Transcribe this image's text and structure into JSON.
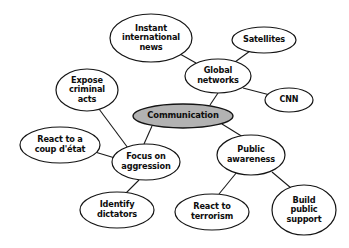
{
  "diagram": {
    "type": "mind-map",
    "background_color": "#ffffff",
    "node_fill_color": "#ffffff",
    "central_node_fill_color": "#b2b2b2",
    "stroke_color": "#141414",
    "text_color": "#0d0d0d",
    "nodes": [
      {
        "id": "communication",
        "label": "Communication",
        "role": "central",
        "cx": 183,
        "cy": 116,
        "rx": 50,
        "ry": 12
      },
      {
        "id": "global-networks",
        "label": "Global\nnetworks",
        "role": "branch",
        "cx": 218,
        "cy": 76,
        "rx": 33,
        "ry": 17
      },
      {
        "id": "instant-international-news",
        "label": "Instant\ninternational\nnews",
        "role": "leaf",
        "cx": 151,
        "cy": 38,
        "rx": 41,
        "ry": 24
      },
      {
        "id": "satellites",
        "label": "Satellites",
        "role": "leaf",
        "cx": 264,
        "cy": 40,
        "rx": 32,
        "ry": 13
      },
      {
        "id": "cnn",
        "label": "CNN",
        "role": "leaf",
        "cx": 289,
        "cy": 100,
        "rx": 24,
        "ry": 12
      },
      {
        "id": "expose-criminal-acts",
        "label": "Expose\ncriminal\nacts",
        "role": "leaf",
        "cx": 87,
        "cy": 90,
        "rx": 31,
        "ry": 21
      },
      {
        "id": "react-to-a-coup-detat",
        "label": "React to a\ncoup d'état",
        "role": "leaf",
        "cx": 60,
        "cy": 145,
        "rx": 40,
        "ry": 18
      },
      {
        "id": "focus-on-aggression",
        "label": "Focus on\naggression",
        "role": "branch",
        "cx": 146,
        "cy": 162,
        "rx": 34,
        "ry": 18
      },
      {
        "id": "identify-dictators",
        "label": "Identify\ndictators",
        "role": "leaf",
        "cx": 117,
        "cy": 210,
        "rx": 37,
        "ry": 18
      },
      {
        "id": "public-awareness",
        "label": "Public\nawareness",
        "role": "branch",
        "cx": 251,
        "cy": 155,
        "rx": 34,
        "ry": 20
      },
      {
        "id": "react-to-terrorism",
        "label": "React to\nterrorism",
        "role": "leaf",
        "cx": 212,
        "cy": 212,
        "rx": 37,
        "ry": 18
      },
      {
        "id": "build-public-support",
        "label": "Build\npublic\nsupport",
        "role": "leaf",
        "cx": 304,
        "cy": 210,
        "rx": 32,
        "ry": 25
      }
    ],
    "edges": [
      {
        "from": "communication",
        "to": "global-networks",
        "x1": 210,
        "y1": 105,
        "x2": 218,
        "y2": 93
      },
      {
        "from": "communication",
        "to": "focus-on-aggression",
        "x1": 152,
        "y1": 126,
        "x2": 144,
        "y2": 144
      },
      {
        "from": "communication",
        "to": "public-awareness",
        "x1": 222,
        "y1": 124,
        "x2": 243,
        "y2": 137
      },
      {
        "from": "global-networks",
        "to": "instant-international-news",
        "x1": 196,
        "y1": 63,
        "x2": 180,
        "y2": 54
      },
      {
        "from": "global-networks",
        "to": "satellites",
        "x1": 235,
        "y1": 62,
        "x2": 250,
        "y2": 51
      },
      {
        "from": "global-networks",
        "to": "cnn",
        "x1": 243,
        "y1": 88,
        "x2": 270,
        "y2": 95
      },
      {
        "from": "focus-on-aggression",
        "to": "expose-criminal-acts",
        "x1": 128,
        "y1": 148,
        "x2": 99,
        "y2": 109
      },
      {
        "from": "focus-on-aggression",
        "to": "react-to-a-coup-detat",
        "x1": 115,
        "y1": 158,
        "x2": 95,
        "y2": 152
      },
      {
        "from": "focus-on-aggression",
        "to": "identify-dictators",
        "x1": 139,
        "y1": 180,
        "x2": 126,
        "y2": 193
      },
      {
        "from": "public-awareness",
        "to": "react-to-terrorism",
        "x1": 237,
        "y1": 172,
        "x2": 219,
        "y2": 194
      },
      {
        "from": "public-awareness",
        "to": "build-public-support",
        "x1": 272,
        "y1": 172,
        "x2": 291,
        "y2": 188
      }
    ]
  }
}
